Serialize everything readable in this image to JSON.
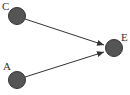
{
  "diagram": {
    "type": "directed-graph",
    "nodes": [
      {
        "id": "C",
        "label": "C",
        "cx": 17,
        "cy": 16,
        "r": 8.5
      },
      {
        "id": "A",
        "label": "A",
        "cx": 17,
        "cy": 80,
        "r": 8.5
      },
      {
        "id": "E",
        "label": "E",
        "cx": 114,
        "cy": 48,
        "r": 8.5
      }
    ],
    "edges": [
      {
        "from": "C",
        "to": "E"
      },
      {
        "from": "A",
        "to": "E"
      }
    ],
    "colors": {
      "node_fill": "#555555",
      "node_stroke": "#333333",
      "edge": "#333333",
      "label": "#333333"
    }
  }
}
